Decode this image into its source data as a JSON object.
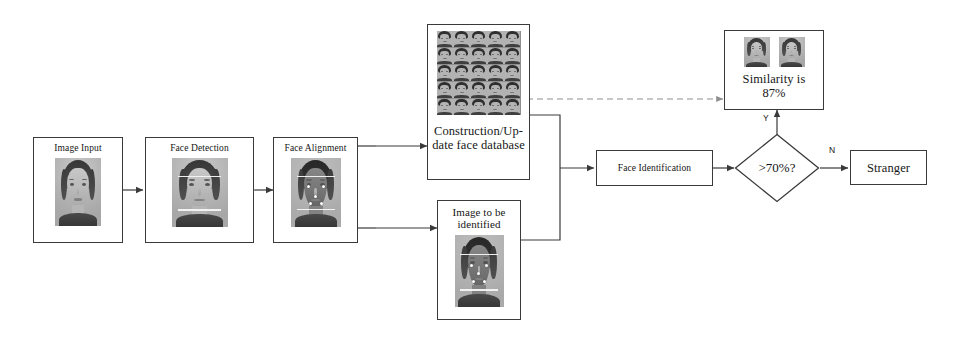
{
  "diagram": {
    "background_color": "#ffffff",
    "stroke_color": "#3a3a3a",
    "dashed_stroke_color": "#8f8f8f"
  },
  "nodes": {
    "image_input": {
      "label": "Image Input",
      "shape": "rectangle"
    },
    "face_detection": {
      "label": "Face Detection",
      "shape": "rectangle"
    },
    "face_alignment": {
      "label": "Face Alignment",
      "shape": "rectangle"
    },
    "face_database": {
      "label": "Construction/Up-\ndate face database",
      "shape": "rectangle",
      "thumbnail_rows": 5,
      "thumbnail_cols": 5
    },
    "image_to_identify": {
      "label": "Image to be\nidentified",
      "shape": "rectangle"
    },
    "face_identification": {
      "label": "Face Identification",
      "shape": "rectangle"
    },
    "threshold_decision": {
      "label": ">70%?",
      "shape": "diamond"
    },
    "similarity_result": {
      "label": "Similarity is\n87%",
      "shape": "rectangle",
      "value": "87%"
    },
    "stranger": {
      "label": "Stranger",
      "shape": "rectangle"
    }
  },
  "edge_labels": {
    "yes": "Y",
    "no": "N"
  }
}
